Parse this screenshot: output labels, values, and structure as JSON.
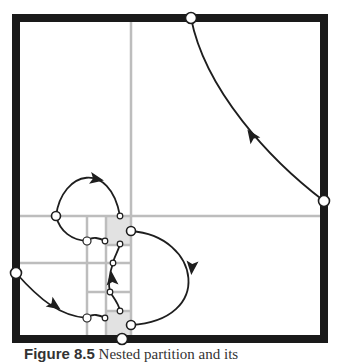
{
  "figure": {
    "colors": {
      "frame": "#1a1a1a",
      "grid": "#bdbdbd",
      "shade": "#e2e2e2",
      "curve": "#1e1e1e",
      "node_fill": "#ffffff",
      "node_stroke": "#1e1e1e"
    },
    "frame": {
      "x1": 16,
      "y1": 18,
      "x2": 324,
      "y2": 339,
      "stroke_width": 8
    },
    "grid_lines": [
      {
        "id": "v-main",
        "x1": 131,
        "y1": 22,
        "x2": 131,
        "y2": 335
      },
      {
        "id": "h-main",
        "x1": 20,
        "y1": 216,
        "x2": 320,
        "y2": 216
      },
      {
        "id": "v-87",
        "x1": 87,
        "y1": 216,
        "x2": 87,
        "y2": 335
      },
      {
        "id": "v-106",
        "x1": 106,
        "y1": 216,
        "x2": 106,
        "y2": 335
      },
      {
        "id": "h-263",
        "x1": 20,
        "y1": 263,
        "x2": 131,
        "y2": 263
      },
      {
        "id": "h-292",
        "x1": 87,
        "y1": 292,
        "x2": 131,
        "y2": 292
      },
      {
        "id": "h-311",
        "x1": 106,
        "y1": 311,
        "x2": 131,
        "y2": 311
      },
      {
        "id": "h-245",
        "x1": 106,
        "y1": 245,
        "x2": 131,
        "y2": 245
      }
    ],
    "shaded_cells": [
      {
        "x": 106,
        "y": 216,
        "w": 25,
        "h": 29
      },
      {
        "x": 106,
        "y": 311,
        "w": 25,
        "h": 24
      }
    ],
    "curves": [
      {
        "id": "arc-right-to-top",
        "d": "M 324 201 C 270 160, 205 90, 191 18"
      },
      {
        "id": "loop-upper-left",
        "d": "M 56 216 C 62 170, 110 160, 120 216"
      },
      {
        "id": "link-87-105-top",
        "d": "M 87 241 C 92 236, 100 238, 105 241"
      },
      {
        "id": "arc-56-87",
        "d": "M 56 216 C 60 232, 72 240, 87 241"
      },
      {
        "id": "right-loop",
        "d": "M 131 231 C 200 236, 215 320, 131 325"
      },
      {
        "id": "chain-120-113",
        "d": "M 120 244 C 118 252, 114 257, 113 263"
      },
      {
        "id": "chain-113-110",
        "d": "M 113 263 C 110 272, 108 284, 110 292"
      },
      {
        "id": "chain-110-120",
        "d": "M 110 292 C 114 298, 119 304, 120 311"
      },
      {
        "id": "arc-left-to-87",
        "d": "M 16 273 C 40 300, 60 316, 87 318"
      },
      {
        "id": "link-87-105-bottom",
        "d": "M 87 318 C 92 313, 100 315, 105 318"
      }
    ],
    "arrows": [
      {
        "id": "arrow-top-arc",
        "x": 252,
        "y": 136,
        "angle": -125
      },
      {
        "id": "arrow-upper-loop",
        "x": 96,
        "y": 179,
        "angle": 10
      },
      {
        "id": "arrow-right-loop",
        "x": 192,
        "y": 267,
        "angle": 95
      },
      {
        "id": "arrow-chain",
        "x": 112,
        "y": 279,
        "angle": -95
      },
      {
        "id": "arrow-left-arc",
        "x": 54,
        "y": 305,
        "angle": 35
      }
    ],
    "nodes": [
      {
        "id": "node-top",
        "x": 191,
        "y": 18,
        "r": 5.5
      },
      {
        "id": "node-right",
        "x": 324,
        "y": 201,
        "r": 5.5
      },
      {
        "id": "node-left",
        "x": 16,
        "y": 273,
        "r": 5.5
      },
      {
        "id": "node-bottom",
        "x": 122,
        "y": 339,
        "r": 5.5
      },
      {
        "id": "node-56-216",
        "x": 56,
        "y": 216,
        "r": 4.5
      },
      {
        "id": "node-131-231",
        "x": 131,
        "y": 231,
        "r": 4.5
      },
      {
        "id": "node-131-325",
        "x": 131,
        "y": 325,
        "r": 4.5
      },
      {
        "id": "node-87-241",
        "x": 87,
        "y": 241,
        "r": 4
      },
      {
        "id": "node-87-318",
        "x": 87,
        "y": 318,
        "r": 4
      },
      {
        "id": "node-120-216",
        "x": 120,
        "y": 216,
        "r": 2.8
      },
      {
        "id": "node-105-241",
        "x": 105,
        "y": 241,
        "r": 2.8
      },
      {
        "id": "node-120-244",
        "x": 120,
        "y": 244,
        "r": 2.8
      },
      {
        "id": "node-113-263",
        "x": 113,
        "y": 263,
        "r": 2.8
      },
      {
        "id": "node-110-292",
        "x": 110,
        "y": 292,
        "r": 2.8
      },
      {
        "id": "node-120-311",
        "x": 120,
        "y": 311,
        "r": 2.8
      },
      {
        "id": "node-105-318",
        "x": 105,
        "y": 318,
        "r": 2.8
      }
    ]
  },
  "caption": {
    "label": "Figure 8.5",
    "text": "Nested partition and its"
  }
}
